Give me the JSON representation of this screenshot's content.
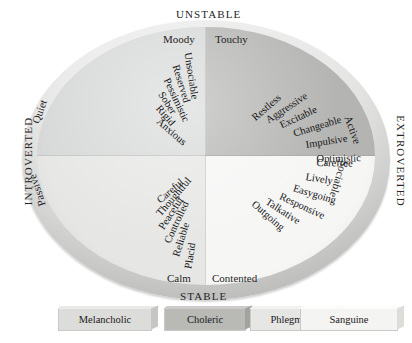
{
  "chart_data": {
    "type": "scatter",
    "xlabel": "INTROVERTED – EXTROVERTED",
    "ylabel": "STABLE – UNSTABLE",
    "axis_poles": {
      "top": "UNSTABLE",
      "bottom": "STABLE",
      "left": "INTROVERTED",
      "right": "EXTROVERTED"
    },
    "cardinal_traits": {
      "top_left": "Moody",
      "top_right": "Touchy",
      "left_upper": "Quiet",
      "left_lower": "Passive",
      "right_upper": "Active",
      "right_lower": "Sociable",
      "bottom_left": "Calm",
      "bottom_right": "Contented"
    },
    "quadrants": [
      {
        "key": "melancholic",
        "temperament": "Melancholic",
        "position": "top-left",
        "color": "#d6d8d7",
        "traits": [
          "Anxious",
          "Rigid",
          "Sober",
          "Pessimistic",
          "Reserved",
          "Unsociable"
        ]
      },
      {
        "key": "choleric",
        "temperament": "Choleric",
        "position": "top-right",
        "color": "#b4b4b2",
        "traits": [
          "Restless",
          "Aggressive",
          "Excitable",
          "Changeable",
          "Impulsive",
          "Optimistic"
        ]
      },
      {
        "key": "phlegmatic",
        "temperament": "Phlegmatic",
        "position": "bottom-left",
        "color": "#e6e7e5",
        "traits": [
          "Careful",
          "Thoughtful",
          "Peaceful",
          "Controlled",
          "Reliable",
          "Placid"
        ]
      },
      {
        "key": "sanguine",
        "temperament": "Sanguine",
        "position": "bottom-right",
        "color": "#f6f6f5",
        "traits": [
          "Outgoing",
          "Talkative",
          "Responsive",
          "Easygoing",
          "Lively",
          "Carefree"
        ]
      }
    ],
    "legend": {
      "position": "bottom",
      "items": [
        {
          "label": "Melancholic",
          "color": "#dcdcda"
        },
        {
          "label": "Choleric",
          "color": "#b9b9b6"
        },
        {
          "label": "Phlegmatic",
          "color": "#e6e6e4"
        },
        {
          "label": "Sanguine",
          "color": "#f4f4f3"
        }
      ]
    }
  }
}
